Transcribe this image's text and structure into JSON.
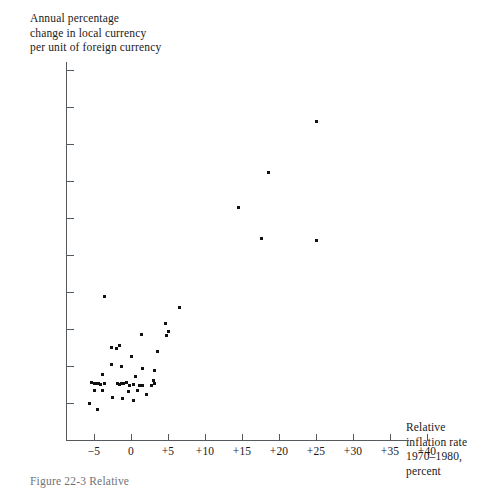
{
  "figure": {
    "caption": "Figure 22-3  Relative",
    "background_color": "#ffffff",
    "ink_color": "#111111",
    "axis_color": "#555a5f"
  },
  "chart_data": {
    "type": "scatter",
    "title": "",
    "ylabel": "Annual percentage\nchange in local currency\nper unit of foreign currency",
    "xlabel": "Relative\ninflation rate\n1970–1980,\npercent",
    "xlim": [
      -7.5,
      41.5
    ],
    "ylim": [
      -11.0,
      42.0
    ],
    "grid": false,
    "legend": null,
    "xticks": [
      -5,
      0,
      5,
      10,
      15,
      20,
      25,
      30,
      35,
      40
    ],
    "xtick_labels": [
      "−5",
      "0",
      "+5",
      "+10",
      "+15",
      "+20",
      "+25",
      "+30",
      "+35",
      "+40"
    ],
    "yticks": [
      -10,
      -5,
      0,
      5,
      10,
      15,
      20,
      25,
      30,
      35,
      40
    ],
    "ytick_labels": [
      "−10",
      "−5",
      "0",
      "+5",
      "+10",
      "+15",
      "+20",
      "+25",
      "+30",
      "+35",
      "+40"
    ],
    "points": [
      [
        25.0,
        33.0
      ],
      [
        18.6,
        26.2
      ],
      [
        14.5,
        21.4
      ],
      [
        17.6,
        17.2
      ],
      [
        25.0,
        17.0
      ],
      [
        -3.6,
        9.4
      ],
      [
        6.6,
        7.9
      ],
      [
        4.6,
        5.7
      ],
      [
        5.0,
        4.6
      ],
      [
        4.8,
        4.1
      ],
      [
        1.4,
        4.2
      ],
      [
        -1.5,
        2.8
      ],
      [
        -2.6,
        2.5
      ],
      [
        -1.9,
        2.4
      ],
      [
        3.6,
        2.0
      ],
      [
        0.0,
        1.3
      ],
      [
        -2.6,
        0.2
      ],
      [
        -1.3,
        -0.1
      ],
      [
        1.5,
        -0.4
      ],
      [
        3.2,
        -0.6
      ],
      [
        -3.9,
        -1.2
      ],
      [
        0.6,
        -1.4
      ],
      [
        3.0,
        -1.9
      ],
      [
        3.2,
        -2.3
      ],
      [
        -5.4,
        -2.2
      ],
      [
        -5.0,
        -2.3
      ],
      [
        -4.7,
        -2.4
      ],
      [
        -4.4,
        -2.3
      ],
      [
        -4.1,
        -2.5
      ],
      [
        -3.6,
        -2.3
      ],
      [
        -1.8,
        -2.3
      ],
      [
        -1.5,
        -2.5
      ],
      [
        -1.3,
        -2.3
      ],
      [
        -1.0,
        -2.4
      ],
      [
        -0.6,
        -2.2
      ],
      [
        -0.2,
        -2.7
      ],
      [
        0.4,
        -2.5
      ],
      [
        1.2,
        -2.6
      ],
      [
        1.6,
        -2.7
      ],
      [
        2.8,
        -2.7
      ],
      [
        -4.9,
        -3.3
      ],
      [
        -3.9,
        -3.3
      ],
      [
        -0.3,
        -3.5
      ],
      [
        0.9,
        -3.3
      ],
      [
        -2.5,
        -4.2
      ],
      [
        -1.1,
        -4.4
      ],
      [
        2.1,
        -3.9
      ],
      [
        0.3,
        -4.6
      ],
      [
        -5.6,
        -5.0
      ],
      [
        -4.5,
        -5.9
      ]
    ]
  }
}
